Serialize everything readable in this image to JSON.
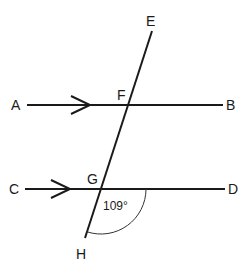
{
  "diagram": {
    "type": "parallel-lines-transversal",
    "points": {
      "A": "A",
      "B": "B",
      "C": "C",
      "D": "D",
      "E": "E",
      "F": "F",
      "G": "G",
      "H": "H"
    },
    "angle_label": "109°",
    "colors": {
      "stroke": "#1a1a1a",
      "background": "#ffffff"
    }
  }
}
